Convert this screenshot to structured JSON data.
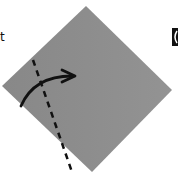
{
  "caption": {
    "partial_text": "t"
  },
  "diagram": {
    "type": "origami-fold-step",
    "paper_color": "#8a8a8a",
    "paper_shade_color": "#939393",
    "line_color": "#111111",
    "fold_line": "dashed",
    "arrow": "fold-over-right",
    "step_icon": "step-marker"
  }
}
